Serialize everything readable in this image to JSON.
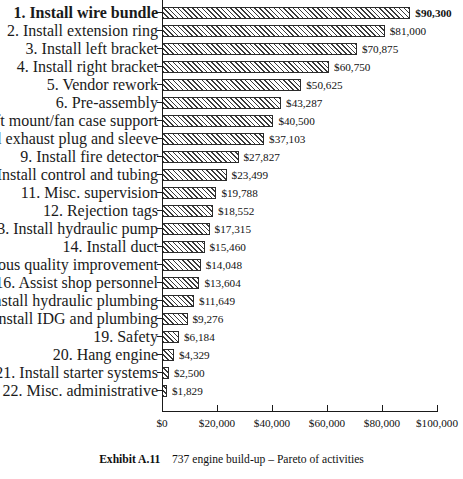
{
  "chart_data": {
    "type": "bar",
    "orientation": "horizontal",
    "title": "",
    "xlabel": "",
    "ylabel": "",
    "xlim": [
      0,
      100000
    ],
    "xticks": [
      0,
      20000,
      40000,
      60000,
      80000,
      100000
    ],
    "xtick_labels": [
      "$0",
      "$20,000",
      "$40,000",
      "$60,000",
      "$80,000",
      "$100,000"
    ],
    "grid": false,
    "legend": null,
    "highlight_index": 0,
    "categories": [
      "1. Install wire bundle",
      "2. Install extension ring",
      "3. Install left bracket",
      "4. Install right bracket",
      "5. Vendor rework",
      "6. Pre-assembly",
      "Install aft mount/fan case support",
      "3. Install exhaust plug and sleeve",
      "9. Install fire detector",
      "10. Install control and tubing",
      "11. Misc. supervision",
      "12. Rejection tags",
      "13. Install hydraulic pump",
      "14. Install duct",
      ". Continuous quality improvement",
      "16. Assist shop personnel",
      "17. Install hydraulic plumbing",
      "18. Install IDG and plumbing",
      "19. Safety",
      "20. Hang engine",
      "21. Install starter systems",
      "22. Misc. administrative"
    ],
    "values": [
      90300,
      81000,
      70875,
      60750,
      50625,
      43287,
      40500,
      37103,
      27827,
      23499,
      19788,
      18552,
      17315,
      15460,
      14048,
      13604,
      11649,
      9276,
      6184,
      4329,
      2500,
      1829
    ],
    "value_labels": [
      "$90,300",
      "$81,000",
      "$70,875",
      "$60,750",
      "$50,625",
      "$43,287",
      "$40,500",
      "$37,103",
      "$27,827",
      "$23,499",
      "$19,788",
      "$18,552",
      "$17,315",
      "$15,460",
      "$14,048",
      "$13,604",
      "$11,649",
      "$9,276",
      "$6,184",
      "$4,329",
      "$2,500",
      "$1,829"
    ]
  },
  "caption": {
    "label": "Exhibit A.11",
    "text": "737 engine build-up – Pareto of activities"
  },
  "style": {
    "bar_border_color": "#2b2b2b",
    "hatch_color": "#3a3a3a",
    "bar_fill_color": "#ffffff",
    "axis_color": "#1a1a1a",
    "text_color": "#121212",
    "background_color": "#ffffff"
  }
}
